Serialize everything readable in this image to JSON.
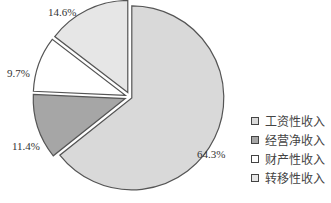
{
  "chart_data": {
    "type": "pie",
    "title": "",
    "start_angle": "12 o'clock",
    "direction": "clockwise",
    "categories": [
      "工资性收入",
      "经营净收入",
      "财产性收入",
      "转移性收入"
    ],
    "values": [
      64.3,
      11.4,
      9.7,
      14.6
    ],
    "value_labels": [
      "64.3%",
      "11.4%",
      "9.7%",
      "14.6%"
    ],
    "colors": [
      "#d9d9d9",
      "#a6a6a6",
      "#ffffff",
      "#e6e6e6"
    ],
    "legend_position": "right-bottom",
    "exploded": true
  },
  "labels": {
    "wage": "64.3%",
    "business": "11.4%",
    "property": "9.7%",
    "transfer": "14.6%"
  },
  "legend": {
    "items": [
      {
        "label": "工资性收入",
        "color": "#d9d9d9"
      },
      {
        "label": "经营净收入",
        "color": "#a6a6a6"
      },
      {
        "label": "财产性收入",
        "color": "#ffffff"
      },
      {
        "label": "转移性收入",
        "color": "#e6e6e6"
      }
    ]
  }
}
